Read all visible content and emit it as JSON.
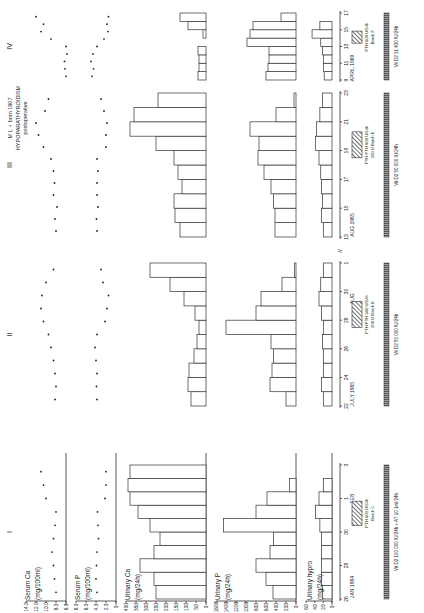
{
  "figure": {
    "orientation": "rotated 90deg counter-clockwise",
    "patient_label": "M L ♀ born 1907",
    "diagnosis": "HYPOPARATHYROIDISM",
    "subtitle": "postoperative",
    "periods": [
      "I",
      "II",
      "III",
      "IV"
    ]
  },
  "axes": [
    {
      "key": "serum_ca",
      "label": "Serum Ca",
      "unit": "(mg/100ml)",
      "ticks": [
        "14.0",
        "12.0",
        "10.0",
        "8.0",
        "6.0"
      ]
    },
    {
      "key": "serum_p",
      "label": "Serum P",
      "unit": "(mg/100ml)",
      "ticks": [
        "8.0",
        "6.0",
        "4.0",
        "2.0",
        "0"
      ]
    },
    {
      "key": "urinary_ca",
      "label": "Urinary Ca",
      "unit": "(mg/24h)",
      "ticks": [
        "400",
        "350",
        "300",
        "250",
        "200",
        "150",
        "100",
        "50",
        "0"
      ]
    },
    {
      "key": "urinary_p",
      "label": "Urinary P",
      "unit": "(mg/24h)",
      "ticks": [
        "1600",
        "1400",
        "1200",
        "1000",
        "800",
        "600",
        "400",
        "200",
        "0"
      ]
    },
    {
      "key": "urinary_hypro",
      "label": "Urinary hypro",
      "unit": "(mg/24h)",
      "ticks": [
        "60",
        "40",
        "20",
        "0"
      ]
    }
  ],
  "chart_data": {
    "type": "bar",
    "layout": "figure rotated 90° CCW; time axis runs bottom→top, values increase leftwards",
    "periods": [
      {
        "name": "I",
        "date_ticks": [
          "26",
          "28",
          "30",
          "1",
          "3"
        ],
        "date_labels": [
          "JAN 1964",
          "FEB"
        ],
        "treatment": [
          "PTH 600 U/24h",
          "Batch C"
        ],
        "vitd": "Vit D2 100 000 IU/24h + AT 10 1ml/24h",
        "days": 10,
        "serum_ca": [
          8.0,
          8.3,
          8.5,
          8.8,
          8.5,
          8.2,
          8.0,
          10.0,
          10.5,
          11.0
        ],
        "serum_p": [
          3.8,
          4.0,
          3.9,
          3.8,
          3.5,
          3.6,
          3.7,
          2.2,
          2.0,
          2.0
        ],
        "urinary_ca": [
          250,
          260,
          330,
          260,
          230,
          280,
          340,
          380,
          390,
          380
        ],
        "urinary_p": [
          460,
          600,
          800,
          520,
          450,
          1450,
          800,
          580,
          130,
          0
        ],
        "urinary_hypro": [
          22,
          24,
          24,
          24,
          24,
          28,
          38,
          30,
          20,
          0
        ]
      },
      {
        "name": "II",
        "date_ticks": [
          "22",
          "24",
          "26",
          "28",
          "30",
          "1"
        ],
        "date_labels": [
          "JULY 1965",
          "AUG"
        ],
        "treatment": [
          "PTH PTH 600 U/24h",
          "200 U Batch E"
        ],
        "vitd": "Vit D2 50 000 IU/24h",
        "days": 11,
        "serum_ca": [
          8.2,
          8.0,
          8.2,
          8.5,
          9.0,
          9.5,
          10.5,
          11.0,
          10.8,
          10.0,
          8.5
        ],
        "serum_p": [
          3.8,
          3.9,
          3.8,
          4.0,
          4.2,
          3.8,
          2.2,
          1.8,
          1.5,
          2.6,
          3.0
        ],
        "urinary_ca": [
          75,
          90,
          85,
          60,
          45,
          35,
          55,
          110,
          180,
          280
        ],
        "urinary_p": [
          200,
          520,
          480,
          450,
          500,
          1400,
          800,
          700,
          280,
          30
        ],
        "urinary_hypro": [
          20,
          24,
          20,
          20,
          22,
          20,
          24,
          30,
          26,
          20
        ]
      },
      {
        "name": "III",
        "date_ticks": [
          "13",
          "15",
          "17",
          "19",
          "21",
          "23"
        ],
        "date_labels": [
          "AUG 1965"
        ],
        "treatment": [
          "PTH PTH 600 U/24h",
          "200 U Batch E"
        ],
        "vitd": "Vit D2 50 000 IU/24h",
        "days": 11,
        "serum_ca": [
          8.0,
          8.2,
          7.8,
          8.5,
          8.3,
          8.5,
          9.0,
          10.5,
          11.5,
          12.0,
          10.2,
          9.5
        ],
        "serum_p": [
          3.8,
          3.9,
          3.6,
          3.8,
          3.8,
          3.6,
          3.8,
          2.0,
          2.0,
          1.8,
          2.4,
          3.0
        ],
        "urinary_ca": [
          130,
          155,
          160,
          120,
          140,
          160,
          250,
          380,
          360,
          240
        ],
        "urinary_p": [
          420,
          420,
          450,
          500,
          640,
          760,
          740,
          920,
          400,
          40
        ],
        "urinary_hypro": [
          20,
          24,
          22,
          24,
          26,
          30,
          38,
          36,
          28,
          22
        ]
      },
      {
        "name": "IV",
        "date_ticks": [
          "9",
          "11",
          "13",
          "15",
          "17"
        ],
        "date_labels": [
          "APRIL 1969"
        ],
        "treatment": [
          "PTH 600 U/24h",
          "Batch F"
        ],
        "vitd": "Vit D2 31 430 IU/24h",
        "days": 9,
        "serum_ca": [
          6.0,
          6.2,
          6.3,
          5.8,
          6.0,
          9.0,
          11.0,
          10.5,
          12.0
        ],
        "serum_p": [
          4.8,
          4.5,
          5.0,
          4.6,
          3.8,
          2.4,
          1.6,
          1.8,
          1.5
        ],
        "urinary_ca": [
          40,
          35,
          35,
          40,
          0,
          15,
          90,
          130
        ],
        "urinary_p": [
          600,
          560,
          540,
          540,
          980,
          920,
          860,
          300
        ],
        "urinary_hypro": [
          18,
          20,
          20,
          22,
          26,
          46,
          28,
          0
        ]
      }
    ]
  }
}
